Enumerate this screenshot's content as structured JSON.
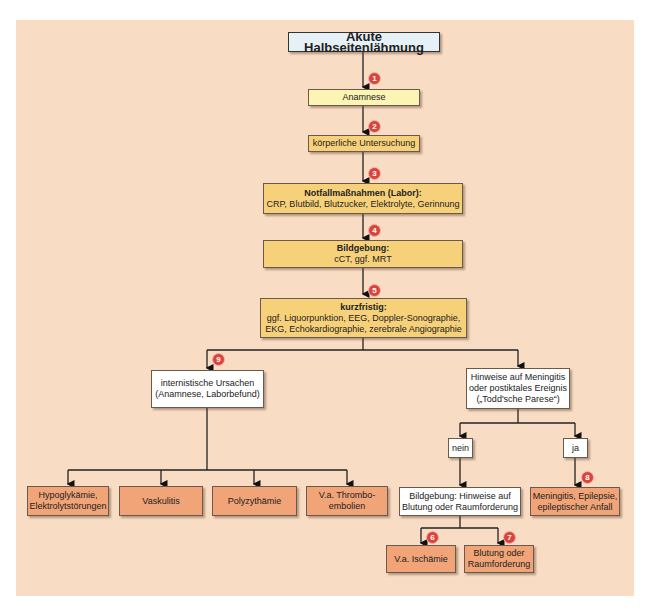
{
  "title": "Akute Halbseitenlähmung",
  "steps": [
    {
      "num": "1",
      "label": "Anamnese"
    },
    {
      "num": "2",
      "label": "körperliche Untersuchung"
    },
    {
      "num": "3",
      "heading": "Notfallmaßnahmen (Labor):",
      "detail": "CRP, Blutbild, Blutzucker, Elektrolyte, Gerinnung"
    },
    {
      "num": "4",
      "heading": "Bildgebung:",
      "detail": "cCT, ggf. MRT"
    },
    {
      "num": "5",
      "heading": "kurzfristig:",
      "detail1": "ggf. Liquorpunktion, EEG, Doppler-Sonographie,",
      "detail2": "EKG, Echokardiographie, zerebrale Angiographie"
    }
  ],
  "left_branch": {
    "num": "9",
    "line1": "internistische Ursachen",
    "line2": "(Anamnese, Laborbefund)",
    "outcomes": [
      {
        "line1": "Hypoglykämie,",
        "line2": "Elektrolytstörungen"
      },
      {
        "line1": "Vaskulitis",
        "line2": ""
      },
      {
        "line1": "Polyzythämie",
        "line2": ""
      },
      {
        "line1": "V.a. Thrombo-",
        "line2": "embolien"
      }
    ]
  },
  "right_branch": {
    "line1": "Hinweise auf Meningitis",
    "line2": "oder postiktales Ereignis",
    "line3": "(„Todd'sche Parese“)",
    "no_label": "nein",
    "yes_label": "ja",
    "imaging": {
      "line1": "Bildgebung: Hinweise auf",
      "line2": "Blutung oder Raumforderung"
    },
    "ischemia": {
      "num": "6",
      "label": "V.a. Ischämie"
    },
    "bleeding": {
      "num": "7",
      "line1": "Blutung oder",
      "line2": "Raumforderung"
    },
    "yes_outcome": {
      "num": "8",
      "line1": "Meningitis, Epilepsie,",
      "line2": "epileptischer Anfall"
    }
  },
  "colors": {
    "panel": "#f9dcc4",
    "title": "#e6f0f7",
    "yellow": "#fbf4b2",
    "gold": "#f7d17a",
    "orange": "#f0a477",
    "badge": "#d9453d"
  }
}
